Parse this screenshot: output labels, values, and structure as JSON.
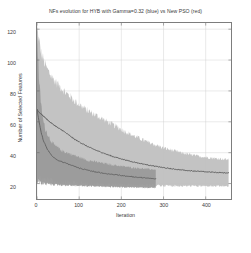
{
  "chart_data": {
    "type": "line",
    "title": "NFs evolution for HYB with Gamma=0.32 (blue) vs New PSO (red)",
    "xlabel": "Iteration",
    "ylabel": "Number of Selected Features",
    "xlim": [
      0,
      460
    ],
    "ylim": [
      10,
      124
    ],
    "xticks": [
      0,
      100,
      200,
      300,
      400
    ],
    "yticks": [
      20,
      40,
      60,
      80,
      100,
      120
    ],
    "grid": true,
    "legend": "none",
    "legend_note": "HYB with Gamma=0.32 drawn in blue, New PSO drawn in red (image rendered desaturated/grayscale)",
    "series": [
      {
        "name": "HYB with Gamma=0.32 (blue)",
        "color": "#5a5a5a",
        "band_color": "#9a9a9a",
        "x_end": 282,
        "x": [
          0,
          5,
          10,
          15,
          20,
          25,
          30,
          35,
          40,
          45,
          50,
          55,
          60,
          70,
          80,
          90,
          100,
          110,
          120,
          130,
          140,
          150,
          160,
          170,
          180,
          190,
          200,
          210,
          220,
          230,
          240,
          250,
          260,
          270,
          282
        ],
        "mean": [
          68,
          60,
          53,
          48,
          45,
          42,
          40,
          38,
          37,
          36,
          35,
          34.5,
          34,
          33,
          32,
          31,
          30,
          29.3,
          28.7,
          28,
          27.5,
          27,
          26.6,
          26.2,
          25.9,
          25.6,
          25.2,
          24.9,
          24.6,
          24.3,
          24,
          23.8,
          23.5,
          23.3,
          23
        ],
        "band_upper": [
          118,
          86,
          70,
          60,
          55,
          52,
          49,
          47,
          45,
          44,
          43,
          42,
          41,
          40,
          39,
          38,
          37,
          36,
          35,
          34.5,
          34,
          33.5,
          33,
          32.5,
          32,
          31.6,
          31.2,
          30.9,
          30.5,
          30.2,
          30,
          29.7,
          29.4,
          29.2,
          29
        ],
        "band_lower": [
          22,
          21,
          20.5,
          20,
          20,
          19.8,
          19.6,
          19.5,
          19.4,
          19.3,
          19.2,
          19.1,
          19,
          18.9,
          18.8,
          18.7,
          18.6,
          18.5,
          18.4,
          18.3,
          18.2,
          18.1,
          18,
          17.9,
          17.8,
          17.7,
          17.6,
          17.6,
          17.5,
          17.5,
          17.4,
          17.4,
          17.3,
          17.3,
          17.2
        ]
      },
      {
        "name": "New PSO (red)",
        "color": "#4e4e4e",
        "band_color": "#c0c0c0",
        "x_end": 455,
        "x": [
          0,
          5,
          10,
          20,
          30,
          40,
          50,
          60,
          70,
          80,
          90,
          100,
          120,
          140,
          160,
          180,
          200,
          220,
          240,
          260,
          280,
          300,
          320,
          340,
          360,
          380,
          400,
          420,
          440,
          455
        ],
        "mean": [
          68,
          66,
          65,
          62.5,
          60,
          58,
          56,
          54.5,
          52.5,
          50.5,
          48.5,
          47,
          44,
          41.5,
          39.5,
          37.5,
          36,
          34.5,
          33.3,
          32.2,
          31.2,
          30.3,
          29.5,
          28.9,
          28.4,
          28,
          27.6,
          27.3,
          27,
          26.8
        ],
        "band_upper": [
          120,
          112,
          104,
          96,
          91,
          87,
          84,
          81,
          78,
          76,
          73,
          71,
          67,
          64,
          61,
          58,
          55,
          52,
          49.5,
          47,
          45,
          43,
          41.5,
          40,
          38.8,
          37.8,
          37,
          36.3,
          35.8,
          35.5
        ],
        "band_lower": [
          24,
          23.5,
          23,
          22.5,
          22,
          21.5,
          21.2,
          21,
          20.8,
          20.6,
          20.4,
          20.2,
          20,
          19.8,
          19.6,
          19.4,
          19.2,
          19.1,
          19,
          18.9,
          18.8,
          18.7,
          18.6,
          18.5,
          18.5,
          18.4,
          18.4,
          18.3,
          18.3,
          18.2
        ]
      }
    ]
  },
  "axes": {
    "yticks": [
      {
        "value": "120"
      },
      {
        "value": "100"
      },
      {
        "value": "80"
      },
      {
        "value": "60"
      },
      {
        "value": "40"
      },
      {
        "value": "20"
      }
    ],
    "xticks": [
      {
        "value": "0"
      },
      {
        "value": "100"
      },
      {
        "value": "200"
      },
      {
        "value": "300"
      },
      {
        "value": "400"
      }
    ]
  }
}
